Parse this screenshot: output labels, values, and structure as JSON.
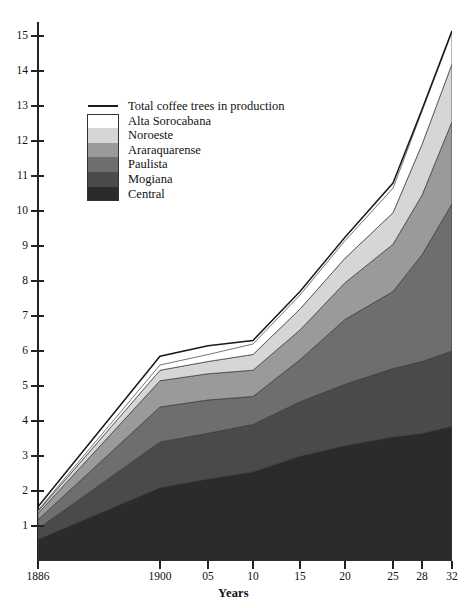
{
  "chart_data": {
    "type": "area",
    "title": "",
    "subtitle": "",
    "xlabel": "Years",
    "ylabel": "",
    "stacked": true,
    "grid": false,
    "legend_position": "inside-upper-left",
    "xlim": [
      1886,
      1932
    ],
    "ylim": [
      0,
      15.4
    ],
    "y_ticks": [
      1,
      2,
      3,
      4,
      5,
      6,
      7,
      8,
      9,
      10,
      11,
      12,
      13,
      14,
      15
    ],
    "x": [
      1886,
      1900,
      1905,
      1910,
      1915,
      1920,
      1925,
      1928,
      1932
    ],
    "x_tick_labels": [
      "1886",
      "1900",
      "05",
      "10",
      "15",
      "20",
      "25",
      "28",
      "32"
    ],
    "series": [
      {
        "name": "Central",
        "color": "#2b2b2b",
        "values": [
          0.62,
          2.1,
          2.35,
          2.55,
          3.0,
          3.3,
          3.55,
          3.65,
          3.85
        ]
      },
      {
        "name": "Mogiana",
        "color": "#4a4a4a",
        "values": [
          0.3,
          1.3,
          1.3,
          1.35,
          1.55,
          1.75,
          1.95,
          2.05,
          2.15
        ]
      },
      {
        "name": "Paulista",
        "color": "#6e6e6e",
        "values": [
          0.26,
          1.0,
          0.95,
          0.8,
          1.2,
          1.85,
          2.2,
          3.05,
          4.2
        ]
      },
      {
        "name": "Araraquarense",
        "color": "#9a9a9a",
        "values": [
          0.18,
          0.75,
          0.75,
          0.75,
          0.85,
          1.05,
          1.35,
          1.7,
          2.35
        ]
      },
      {
        "name": "Noroeste",
        "color": "#d6d6d6",
        "values": [
          0.06,
          0.3,
          0.35,
          0.45,
          0.6,
          0.7,
          0.9,
          1.45,
          1.65
        ]
      },
      {
        "name": "Alta Sorocabana",
        "color": "#ffffff",
        "values": [
          0.03,
          0.15,
          0.2,
          0.3,
          0.4,
          0.5,
          0.7,
          0.95,
          0.9
        ]
      }
    ],
    "total_line": {
      "name": "Total coffee trees in production",
      "color": "#1a1a1a",
      "values": [
        1.55,
        5.85,
        6.15,
        6.3,
        7.7,
        9.25,
        10.8,
        12.9,
        15.15
      ]
    }
  },
  "legend": {
    "entries": [
      {
        "label": "Total coffee trees in production",
        "kind": "line",
        "color": "#1a1a1a"
      },
      {
        "label": "Alta Sorocabana",
        "kind": "swatch",
        "color": "#ffffff"
      },
      {
        "label": "Noroeste",
        "kind": "swatch",
        "color": "#d6d6d6"
      },
      {
        "label": "Araraquarense",
        "kind": "swatch",
        "color": "#9a9a9a"
      },
      {
        "label": "Paulista",
        "kind": "swatch",
        "color": "#6e6e6e"
      },
      {
        "label": "Mogiana",
        "kind": "swatch",
        "color": "#4a4a4a"
      },
      {
        "label": "Central",
        "kind": "swatch",
        "color": "#2b2b2b"
      }
    ]
  },
  "axes": {
    "x_title": "Years"
  },
  "colors": {
    "axis": "#222222",
    "background": "#ffffff",
    "text": "#111111"
  }
}
